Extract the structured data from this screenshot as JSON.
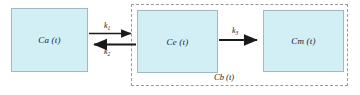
{
  "diagram": {
    "type": "compartment-model",
    "background_color": "#ffffff",
    "box_fill_color": "#d3eff6",
    "box_border_color": "#9fb8c4",
    "group_border_color": "#9a9a9a",
    "arrow_color": "#1a1a1a",
    "text_color": "#1a1a2e",
    "compartments": [
      {
        "id": "ca",
        "label": "Ca (t)",
        "symbol": "Ca",
        "argument": "t"
      },
      {
        "id": "ce",
        "label": "Ce (t)",
        "symbol": "Ce",
        "argument": "t"
      },
      {
        "id": "cm",
        "label": "Cm (t)",
        "symbol": "Cm",
        "argument": "t"
      }
    ],
    "group": {
      "id": "cb",
      "label": "Cb (t)",
      "symbol": "Cb",
      "argument": "t",
      "contains": [
        "ce",
        "cm"
      ],
      "border_style": "dashed"
    },
    "arrows": [
      {
        "id": "k1",
        "from": "ca",
        "to": "ce",
        "direction": "right",
        "rate_symbol": "k",
        "rate_subscript": "1"
      },
      {
        "id": "k2",
        "from": "ce",
        "to": "ca",
        "direction": "left",
        "rate_symbol": "k",
        "rate_subscript": "2"
      },
      {
        "id": "k3",
        "from": "ce",
        "to": "cm",
        "direction": "right",
        "rate_symbol": "k",
        "rate_subscript": "3"
      }
    ]
  }
}
